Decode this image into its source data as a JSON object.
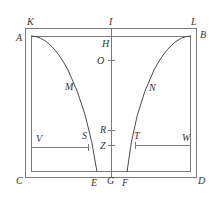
{
  "diagram": {
    "type": "geometric-figure",
    "colors": {
      "line": "#7a7a7a",
      "curve": "#4a4a4a",
      "label": "#333333",
      "background": "#ffffff"
    },
    "labels": {
      "K": "K",
      "I": "I",
      "L": "L",
      "A": "A",
      "H": "H",
      "B": "B",
      "O": "O",
      "M": "M",
      "N": "N",
      "R": "R",
      "S": "S",
      "T": "T",
      "V": "V",
      "Z": "Z",
      "W": "W",
      "C": "C",
      "E": "E",
      "G": "G",
      "F": "F",
      "D": "D"
    }
  }
}
